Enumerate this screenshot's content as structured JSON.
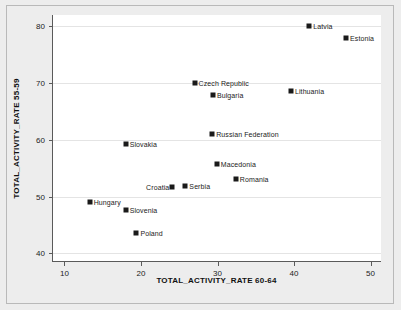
{
  "chart_data": {
    "type": "scatter",
    "title": "",
    "xlabel": "TOTAL_ACTIVITY_RATE 60-64",
    "ylabel": "TOTAL_ACTIVITY_RATE 55-59",
    "xlim": [
      8.5,
      51.5
    ],
    "ylim": [
      38.5,
      82.0
    ],
    "xticks": [
      10,
      20,
      30,
      40,
      50
    ],
    "yticks": [
      40,
      50,
      60,
      70,
      80
    ],
    "grid": true,
    "legend": "none",
    "points": [
      {
        "label": "Latvia",
        "x": 42.0,
        "y": 80.0,
        "label_side": "right"
      },
      {
        "label": "Estonia",
        "x": 46.8,
        "y": 77.9,
        "label_side": "right"
      },
      {
        "label": "Czech Republic",
        "x": 27.0,
        "y": 70.0,
        "label_side": "right"
      },
      {
        "label": "Lithuania",
        "x": 39.6,
        "y": 68.6,
        "label_side": "right"
      },
      {
        "label": "Bulgaria",
        "x": 29.4,
        "y": 67.9,
        "label_side": "right"
      },
      {
        "label": "Russian Federation",
        "x": 29.3,
        "y": 61.0,
        "label_side": "right"
      },
      {
        "label": "Slovakia",
        "x": 18.0,
        "y": 59.3,
        "label_side": "right"
      },
      {
        "label": "Macedonia",
        "x": 29.9,
        "y": 55.7,
        "label_side": "right"
      },
      {
        "label": "Romania",
        "x": 32.4,
        "y": 53.1,
        "label_side": "right"
      },
      {
        "label": "Serbia",
        "x": 25.8,
        "y": 51.9,
        "label_side": "right"
      },
      {
        "label": "Croatia",
        "x": 24.1,
        "y": 51.7,
        "label_side": "left"
      },
      {
        "label": "Hungary",
        "x": 13.3,
        "y": 49.1,
        "label_side": "right"
      },
      {
        "label": "Slovenia",
        "x": 18.0,
        "y": 47.6,
        "label_side": "right"
      },
      {
        "label": "Poland",
        "x": 19.4,
        "y": 43.6,
        "label_side": "right"
      }
    ],
    "colors": {
      "marker": "#1a1a1a",
      "axis": "#5a5a5a",
      "grid": "#e4e4e4",
      "plot_background": "#ffffff",
      "figure_background": "#ededed"
    }
  }
}
